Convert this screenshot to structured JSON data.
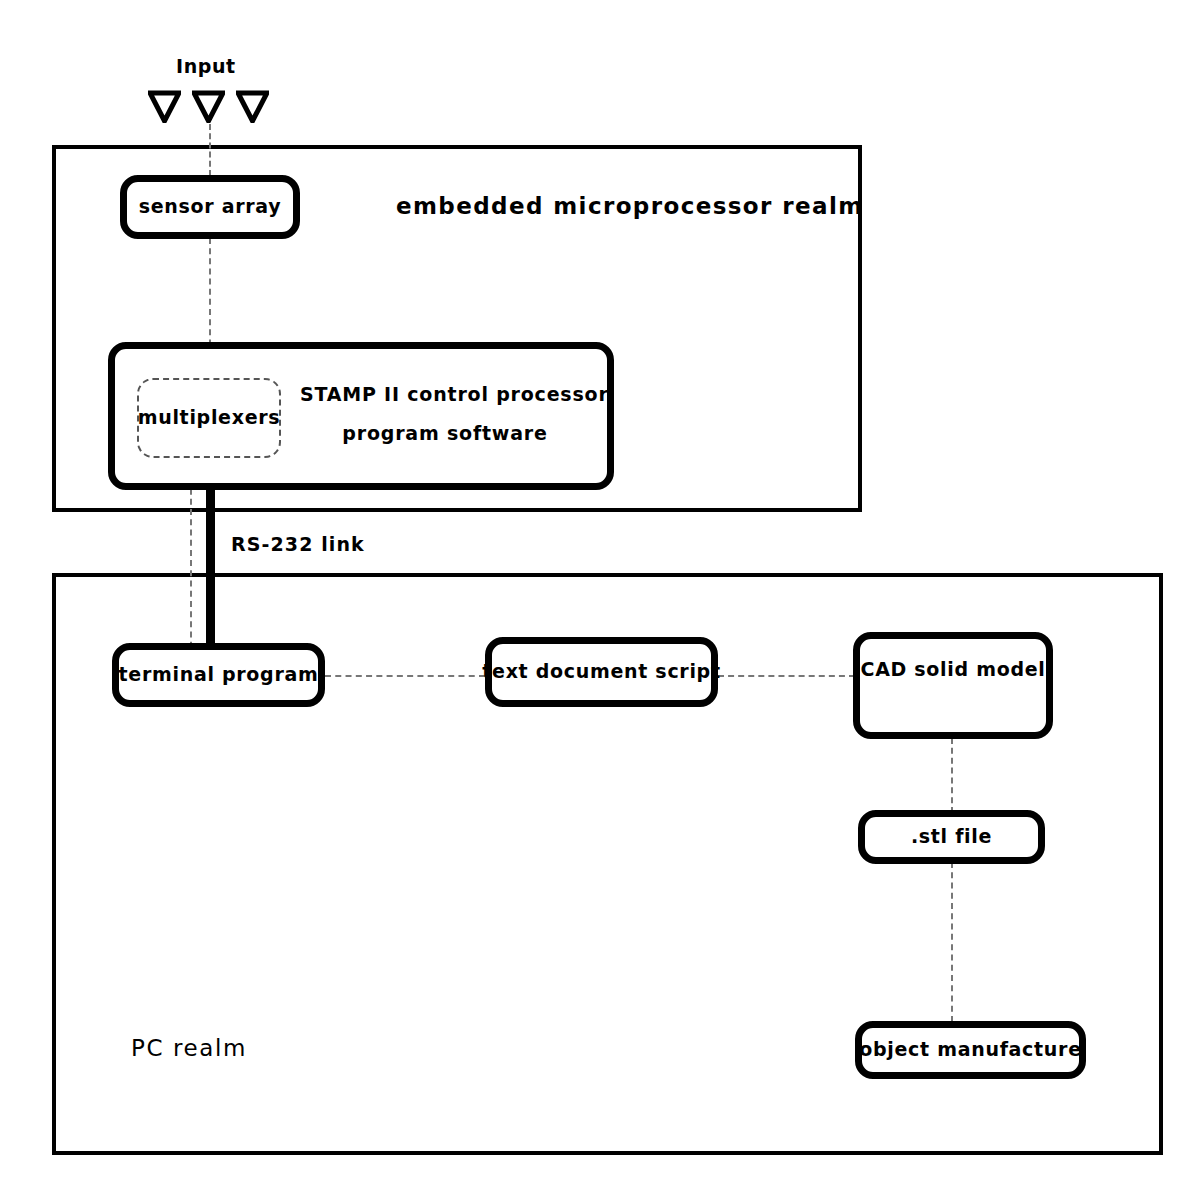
{
  "diagram": {
    "input": {
      "label": "Input",
      "marker_icon": "triangle-down-icon",
      "marker_count": 3
    },
    "realms": [
      {
        "id": "embedded",
        "title": "embedded microprocessor realm"
      },
      {
        "id": "pc",
        "title": "PC realm"
      }
    ],
    "nodes": [
      {
        "id": "sensor-array",
        "label": "sensor array"
      },
      {
        "id": "multiplexers",
        "label": "multiplexers"
      },
      {
        "id": "terminal-program",
        "label": "terminal program"
      },
      {
        "id": "text-document-script",
        "label": "text document script"
      },
      {
        "id": "cad-solid-model",
        "label": "CAD solid model"
      },
      {
        "id": "stl-file",
        "label": ".stl file"
      },
      {
        "id": "object-manufacture",
        "label": "object manufacture"
      }
    ],
    "stamp_box": {
      "line1": "STAMP II control processor",
      "line2": "program software"
    },
    "connections": {
      "rs232_label": "RS-232 link"
    },
    "colors": {
      "ink": "#000000",
      "paper": "#ffffff",
      "dashed": "#777777"
    }
  }
}
